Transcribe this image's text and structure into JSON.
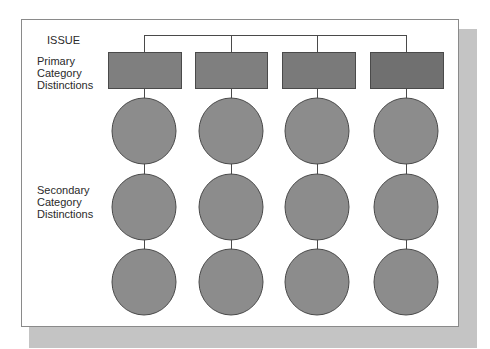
{
  "diagram": {
    "root_label": "ISSUE",
    "primary_label": [
      "Primary",
      "Category",
      "Distinctions"
    ],
    "secondary_label": [
      "Secondary",
      "Category",
      "Distinctions"
    ],
    "columns": 4,
    "rows_of_secondary_nodes": 3,
    "colors": {
      "primary_box_fill": "#7f7f7f",
      "primary_box_fill_last": "#707070",
      "secondary_node_fill": "#8c8c8c",
      "stroke": "#4a4a4a",
      "frame_shadow": "#c4c4c4"
    }
  }
}
